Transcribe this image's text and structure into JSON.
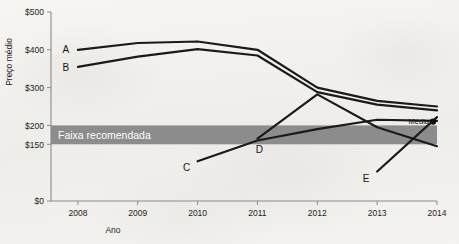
{
  "chart_data": {
    "type": "line",
    "title": "",
    "xlabel": "Ano",
    "ylabel": "Preço médio",
    "x": [
      2008,
      2009,
      2010,
      2011,
      2012,
      2013,
      2014
    ],
    "xtick_labels": [
      "2008",
      "2009",
      "2010",
      "2011",
      "2012",
      "2013",
      "2014"
    ],
    "ytick_labels": [
      "$500",
      "$400",
      "$300",
      "$200",
      "$150",
      "$0"
    ],
    "ytick_values": [
      500,
      400,
      300,
      200,
      150,
      0
    ],
    "ylim": [
      0,
      500
    ],
    "xlim": [
      2007.55,
      2014
    ],
    "grid": false,
    "legend": "inline-series-labels",
    "band": {
      "label": "Faixa recomendada",
      "from": 150,
      "to": 200,
      "color": "#8c8c8c"
    },
    "annotations": [
      {
        "name": "mean-marker",
        "label": "Média",
        "x": 2014,
        "y": 210,
        "marker": "filled-circle"
      }
    ],
    "series": [
      {
        "name": "A",
        "label": "A",
        "x": [
          2008,
          2009,
          2010,
          2011,
          2012,
          2013,
          2014
        ],
        "values": [
          400,
          418,
          422,
          400,
          300,
          265,
          250
        ]
      },
      {
        "name": "B",
        "label": "B",
        "x": [
          2008,
          2009,
          2010,
          2011,
          2012,
          2013,
          2014
        ],
        "values": [
          355,
          382,
          402,
          385,
          288,
          255,
          240
        ]
      },
      {
        "name": "C",
        "label": "C",
        "x": [
          2010,
          2011,
          2012,
          2013,
          2014
        ],
        "values": [
          105,
          160,
          190,
          215,
          212
        ]
      },
      {
        "name": "D",
        "label": "D",
        "x": [
          2011,
          2012,
          2013,
          2014
        ],
        "values": [
          165,
          282,
          195,
          145
        ]
      },
      {
        "name": "E",
        "label": "E",
        "x": [
          2013,
          2014
        ],
        "values": [
          78,
          222
        ]
      }
    ]
  }
}
